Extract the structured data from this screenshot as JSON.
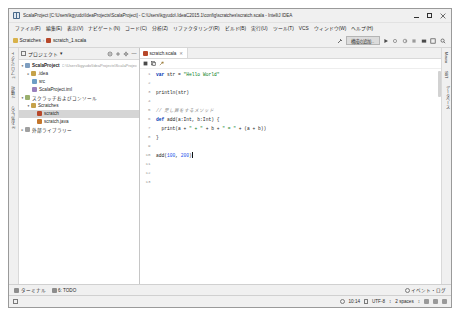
{
  "window": {
    "title": "ScalaProject [C:\\Users\\kgyudo\\IdeaProjects\\ScalaProject] - C:\\Users\\kgyudo\\.IdeaC2015.1\\config\\scratches\\scratch.scala - IntelliJ IDEA",
    "app_icon": "intellij-idea-icon",
    "minimize_label": "–",
    "maximize_label": "□",
    "close_label": "✕"
  },
  "menubar": {
    "items": [
      {
        "label": "ファイル(F)"
      },
      {
        "label": "編集(E)"
      },
      {
        "label": "表示(V)"
      },
      {
        "label": "ナビゲート(N)"
      },
      {
        "label": "コード(C)"
      },
      {
        "label": "分析(Z)"
      },
      {
        "label": "リファクタリング(R)"
      },
      {
        "label": "ビルド(B)"
      },
      {
        "label": "実行(U)"
      },
      {
        "label": "ツール(T)"
      },
      {
        "label": "VCS"
      },
      {
        "label": "ウィンドウ(W)"
      },
      {
        "label": "ヘルプ(H)"
      }
    ]
  },
  "navbar": {
    "breadcrumb": [
      {
        "label": "Scratches",
        "icon": "scratches-folder-icon"
      },
      {
        "label": "scratch_1.scala",
        "icon": "scala-file-icon"
      }
    ],
    "separator": "›",
    "add_configuration_label": "構成の追加...",
    "tools": [
      {
        "name": "build-hammer-icon"
      },
      {
        "name": "run-icon"
      },
      {
        "name": "debug-icon"
      },
      {
        "name": "run-with-coverage-icon"
      },
      {
        "name": "stop-icon"
      },
      {
        "name": "vcs-update-icon"
      },
      {
        "name": "settings-icon"
      },
      {
        "name": "search-everywhere-icon"
      }
    ]
  },
  "left_rail": {
    "tabs": [
      {
        "label": "1: プロジェクト"
      },
      {
        "label": "7: 構造"
      },
      {
        "label": "2: お気に入り"
      }
    ]
  },
  "right_rail": {
    "tabs": [
      {
        "label": "Maven"
      },
      {
        "label": "SBT"
      },
      {
        "label": "データベース"
      }
    ]
  },
  "project_panel": {
    "title": "プロジェクト",
    "dropdown_caret": "▾",
    "header_icons": [
      {
        "name": "collapse-all-icon"
      },
      {
        "name": "expand-all-icon"
      },
      {
        "name": "settings-gear-icon"
      },
      {
        "name": "hide-panel-icon",
        "label": "—"
      }
    ],
    "tree": [
      {
        "label": "ScalaProject",
        "sub": "C:\\Users\\kgyudo\\IdeaProjects\\ScalaProject",
        "icon": "module-icon",
        "arrow": "▾",
        "indent": 0,
        "selected": false
      },
      {
        "label": ".idea",
        "sub": "",
        "icon": "folder-icon",
        "arrow": "▸",
        "indent": 1,
        "selected": false
      },
      {
        "label": "src",
        "sub": "",
        "icon": "source-folder-icon",
        "arrow": "",
        "indent": 1,
        "selected": false
      },
      {
        "label": "ScalaProject.iml",
        "sub": "",
        "icon": "iml-file-icon",
        "arrow": "",
        "indent": 1,
        "selected": false
      },
      {
        "label": "スクラッチおよびコンソール",
        "sub": "",
        "icon": "scratches-root-icon",
        "arrow": "▾",
        "indent": 0,
        "selected": false
      },
      {
        "label": "Scratches",
        "sub": "",
        "icon": "folder-icon",
        "arrow": "▾",
        "indent": 1,
        "selected": false
      },
      {
        "label": "scratch",
        "sub": "",
        "icon": "scala-file-icon",
        "arrow": "",
        "indent": 2,
        "selected": true
      },
      {
        "label": "scratch.java",
        "sub": "",
        "icon": "java-file-icon",
        "arrow": "",
        "indent": 2,
        "selected": false
      },
      {
        "label": "外部ライブラリー",
        "sub": "",
        "icon": "library-icon",
        "arrow": "▸",
        "indent": 0,
        "selected": false
      }
    ]
  },
  "editor": {
    "tab": {
      "label": "scratch.scala",
      "icon": "scala-file-icon",
      "close_label": "✕"
    },
    "gutter_icons": [
      {
        "name": "run-scratch-icon"
      },
      {
        "name": "copy-icon"
      },
      {
        "name": "wrench-icon"
      }
    ],
    "line_numbers": [
      "1",
      "2",
      "3",
      "4",
      "5",
      "6",
      "7",
      "8",
      "9",
      "10",
      "11",
      "12",
      "13"
    ],
    "lines": [
      {
        "n": 1,
        "tokens": [
          {
            "t": "kw",
            "v": "var "
          },
          {
            "t": "txt",
            "v": "str = "
          },
          {
            "t": "str",
            "v": "\"Hello World\""
          }
        ]
      },
      {
        "n": 2,
        "tokens": []
      },
      {
        "n": 3,
        "tokens": [
          {
            "t": "txt",
            "v": "println(str)"
          }
        ]
      },
      {
        "n": 4,
        "tokens": []
      },
      {
        "n": 5,
        "tokens": [
          {
            "t": "cmt",
            "v": "// 足し算をするメソッド"
          }
        ]
      },
      {
        "n": 6,
        "tokens": [
          {
            "t": "kw",
            "v": "def "
          },
          {
            "t": "txt",
            "v": "add(a:Int, b:Int) {"
          }
        ]
      },
      {
        "n": 7,
        "tokens": [
          {
            "t": "txt",
            "v": "  print(a + "
          },
          {
            "t": "str",
            "v": "\" + \""
          },
          {
            "t": "txt",
            "v": " + b + "
          },
          {
            "t": "str",
            "v": "\" = \""
          },
          {
            "t": "txt",
            "v": " + (a + b))"
          }
        ]
      },
      {
        "n": 8,
        "tokens": [
          {
            "t": "txt",
            "v": "}"
          }
        ]
      },
      {
        "n": 9,
        "tokens": []
      },
      {
        "n": 10,
        "tokens": [
          {
            "t": "txt",
            "v": "add("
          },
          {
            "t": "num",
            "v": "100"
          },
          {
            "t": "txt",
            "v": ", "
          },
          {
            "t": "num",
            "v": "200"
          },
          {
            "t": "txt",
            "v": ")"
          },
          {
            "t": "caret",
            "v": ""
          }
        ]
      },
      {
        "n": 11,
        "tokens": []
      },
      {
        "n": 12,
        "tokens": []
      },
      {
        "n": 13,
        "tokens": []
      }
    ]
  },
  "bottom_tabs": {
    "items": [
      {
        "label": "ターミナル",
        "icon": "terminal-icon"
      },
      {
        "label": "6: TODO",
        "icon": "todo-icon"
      }
    ],
    "event_log": {
      "label": "イベント・ログ",
      "icon": "event-log-icon"
    }
  },
  "statusbar": {
    "left_icon": "toggle-toolwindows-icon",
    "caret_position": "10:14",
    "encoding": "UTF-8",
    "indent": "2 spaces",
    "separator": "↕",
    "right_icons": [
      {
        "name": "lock-icon"
      },
      {
        "name": "line-separator-icon"
      },
      {
        "name": "inspection-icon"
      },
      {
        "name": "trash-icon"
      }
    ]
  }
}
